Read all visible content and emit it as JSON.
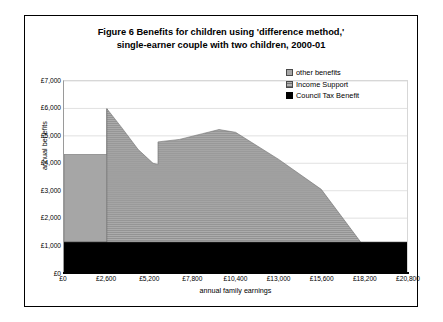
{
  "figure": {
    "title_line1": "Figure 6   Benefits for children using 'difference method,'",
    "title_line2": "single-earner couple with two children, 2000-01"
  },
  "legend": {
    "position": "inside-top-right",
    "items": [
      {
        "label": "other benefits",
        "swatch": "other-benefits-swatch",
        "color": "#a6a6a6"
      },
      {
        "label": "Income Support",
        "swatch": "income-support-swatch",
        "color": "#b2b2b2"
      },
      {
        "label": "Council Tax Benefit",
        "swatch": "council-tax-benefit-swatch",
        "color": "#000000"
      }
    ]
  },
  "chart_data": {
    "type": "area",
    "title": "Figure 6   Benefits for children using 'difference method,' single-earner couple with two children, 2000-01",
    "xlabel": "annual family earnings",
    "ylabel": "annual benefits",
    "stacked": true,
    "grid": true,
    "xlim": [
      0,
      20800
    ],
    "ylim": [
      0,
      7000
    ],
    "xticks": [
      0,
      2600,
      5200,
      7800,
      10400,
      13000,
      15600,
      18200,
      20800
    ],
    "xticklabels": [
      "£0",
      "£2,600",
      "£5,200",
      "£7,800",
      "£10,400",
      "£13,000",
      "£15,600",
      "£18,200",
      "£20,800"
    ],
    "yticks": [
      0,
      1000,
      2000,
      3000,
      4000,
      5000,
      6000,
      7000
    ],
    "yticklabels": [
      "£0",
      "£1,000",
      "£2,000",
      "£3,000",
      "£4,000",
      "£5,000",
      "£6,000",
      "£7,000"
    ],
    "series": [
      {
        "name": "Council Tax Benefit",
        "color": "#000000",
        "points": [
          {
            "x": 0,
            "y": 1120
          },
          {
            "x": 20800,
            "y": 1120
          }
        ]
      },
      {
        "name": "Income Support",
        "color": "#b2b2b2",
        "note": "cumulative top of stack (Council Tax Benefit + Income Support)",
        "points": [
          {
            "x": 0,
            "y": 1120
          },
          {
            "x": 2600,
            "y": 1120
          },
          {
            "x": 2600,
            "y": 5990
          },
          {
            "x": 3500,
            "y": 5300
          },
          {
            "x": 4500,
            "y": 4500
          },
          {
            "x": 5400,
            "y": 4000
          },
          {
            "x": 5700,
            "y": 3960
          },
          {
            "x": 5700,
            "y": 4780
          },
          {
            "x": 7000,
            "y": 4870
          },
          {
            "x": 8400,
            "y": 5080
          },
          {
            "x": 9400,
            "y": 5230
          },
          {
            "x": 10400,
            "y": 5130
          },
          {
            "x": 13000,
            "y": 4150
          },
          {
            "x": 15600,
            "y": 3050
          },
          {
            "x": 18000,
            "y": 1120
          },
          {
            "x": 20800,
            "y": 1120
          }
        ]
      },
      {
        "name": "other benefits",
        "color": "#a6a6a6",
        "note": "cumulative top of stack, nonzero only below £2,600 earnings",
        "points": [
          {
            "x": 0,
            "y": 4320
          },
          {
            "x": 2600,
            "y": 4320
          },
          {
            "x": 2600,
            "y": 5990
          }
        ]
      }
    ],
    "annotations": [
      {
        "text": "flat total of about £4,300 up to £2,600 earnings"
      },
      {
        "text": "peak of about £6,000 at £2,600 earnings"
      },
      {
        "text": "trough of about £3,950 just before £5,700 earnings"
      },
      {
        "text": "secondary peak of about £5,230 near £9,400 earnings"
      },
      {
        "text": "benefits fall to the Council Tax Benefit floor by about £18,000 earnings"
      }
    ]
  }
}
